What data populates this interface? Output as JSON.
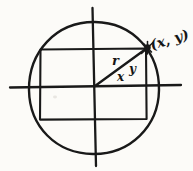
{
  "figure": {
    "labels": {
      "point": "(x, y)",
      "radius": "r",
      "horizontal_leg": "x",
      "vertical_leg": "y"
    },
    "colors": {
      "ink": "#191919",
      "paper": "#fcfbf8"
    }
  }
}
